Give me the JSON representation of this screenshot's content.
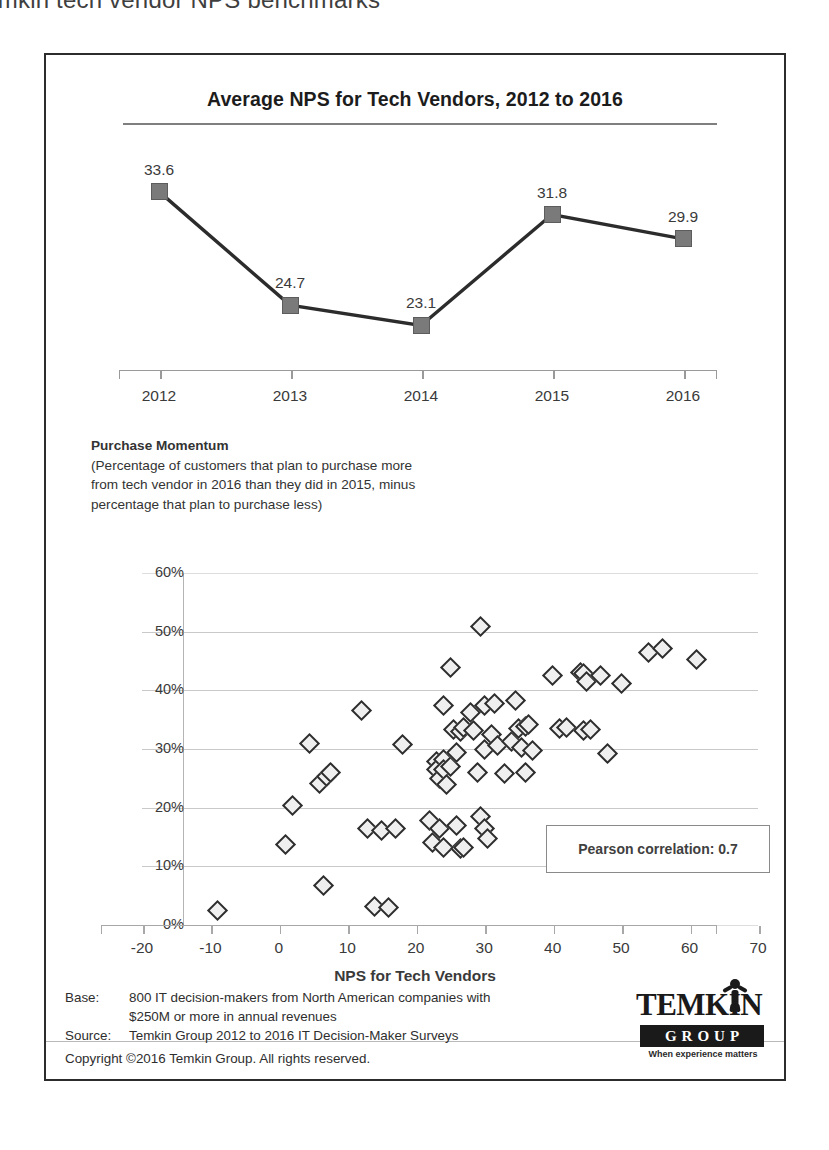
{
  "page": {
    "heading": "Temkin tech vendor NPS benchmarks"
  },
  "line_chart": {
    "title": "Average NPS for Tech Vendors, 2012 to 2016"
  },
  "momentum": {
    "title": "Purchase Momentum",
    "line1": "(Percentage of customers that plan to purchase more",
    "line2": "from tech vendor in 2016 than they did in 2015, minus",
    "line3": "percentage that plan to purchase less)"
  },
  "scatter": {
    "xtitle": "NPS for Tech Vendors",
    "annotation": "Pearson correlation: 0.7"
  },
  "footer": {
    "base_key": "Base:",
    "base_val": "800 IT decision-makers from North American companies with",
    "base_val2": "$250M or more in annual revenues",
    "source_key": "Source:",
    "source_val": "Temkin Group 2012 to 2016 IT Decision-Maker Surveys",
    "copyright": "Copyright ©2016 Temkin Group. All rights reserved."
  },
  "logo": {
    "wordmark": "TEMKIN",
    "group": "GROUP",
    "tagline": "When experience matters"
  },
  "colors": {
    "marker_fill": "#7a7a7a",
    "marker_stroke": "#5c5c5c",
    "line_stroke": "#2c2c2c",
    "dot_fill": "#efefef",
    "dot_stroke": "#2e2e2e",
    "grid": "#c9c9c9",
    "frame": "#2c2c2c"
  },
  "chart_data": [
    {
      "type": "line",
      "title": "Average NPS for Tech Vendors, 2012 to 2016",
      "xlabel": "",
      "ylabel": "",
      "categories": [
        "2012",
        "2013",
        "2014",
        "2015",
        "2016"
      ],
      "values": [
        33.6,
        24.7,
        23.1,
        31.8,
        29.9
      ],
      "data_labels": [
        "33.6",
        "24.7",
        "23.1",
        "31.8",
        "29.9"
      ],
      "ylim": [
        20,
        36
      ],
      "grid": false,
      "legend": "none",
      "marker": "square"
    },
    {
      "type": "scatter",
      "title": "",
      "xlabel": "NPS for Tech Vendors",
      "ylabel": "Purchase Momentum",
      "xlim": [
        -20,
        70
      ],
      "ylim": [
        0,
        60
      ],
      "xticks": [
        -20,
        -10,
        0,
        10,
        20,
        30,
        40,
        50,
        60,
        70
      ],
      "yticks": [
        "0%",
        "10%",
        "20%",
        "30%",
        "40%",
        "50%",
        "60%"
      ],
      "grid": true,
      "legend": "none",
      "marker": "diamond",
      "annotations": [
        "Pearson correlation: 0.7"
      ],
      "pearson_correlation": 0.7,
      "points": [
        [
          -9,
          2.5
        ],
        [
          1,
          13.8
        ],
        [
          2,
          20.3
        ],
        [
          4.5,
          31.0
        ],
        [
          6,
          24.2
        ],
        [
          6.5,
          6.8
        ],
        [
          7,
          25.3
        ],
        [
          7.5,
          26.0
        ],
        [
          12,
          36.6
        ],
        [
          13,
          16.4
        ],
        [
          14,
          3.1
        ],
        [
          15,
          16.1
        ],
        [
          16,
          3.0
        ],
        [
          17,
          16.5
        ],
        [
          18,
          30.8
        ],
        [
          22,
          17.8
        ],
        [
          22.5,
          14.0
        ],
        [
          23,
          27.8
        ],
        [
          23,
          26.5
        ],
        [
          23.5,
          25.0
        ],
        [
          23.5,
          16.5
        ],
        [
          24,
          37.5
        ],
        [
          24,
          28.2
        ],
        [
          24,
          26.5
        ],
        [
          24,
          13.2
        ],
        [
          24.5,
          24.0
        ],
        [
          25,
          27.0
        ],
        [
          25,
          43.9
        ],
        [
          25.5,
          33.3
        ],
        [
          26,
          29.4
        ],
        [
          26,
          17.0
        ],
        [
          26.5,
          33.0
        ],
        [
          26.5,
          13.0
        ],
        [
          27,
          33.6
        ],
        [
          27,
          13.2
        ],
        [
          28,
          36.2
        ],
        [
          28.5,
          33.2
        ],
        [
          29,
          26.0
        ],
        [
          29.5,
          50.9
        ],
        [
          29.5,
          18.5
        ],
        [
          30,
          37.4
        ],
        [
          30,
          30.0
        ],
        [
          30,
          16.5
        ],
        [
          30.5,
          14.7
        ],
        [
          31,
          32.5
        ],
        [
          31.5,
          37.8
        ],
        [
          32,
          30.6
        ],
        [
          33,
          25.8
        ],
        [
          34,
          31.2
        ],
        [
          34.5,
          38.2
        ],
        [
          35,
          33.5
        ],
        [
          35.5,
          30.2
        ],
        [
          36,
          33.8
        ],
        [
          36,
          26.0
        ],
        [
          36.5,
          34.2
        ],
        [
          37,
          29.8
        ],
        [
          40,
          42.5
        ],
        [
          41,
          33.5
        ],
        [
          42,
          33.7
        ],
        [
          44,
          43.0
        ],
        [
          44.5,
          42.9
        ],
        [
          44.5,
          33.2
        ],
        [
          45,
          41.5
        ],
        [
          45.5,
          33.4
        ],
        [
          47,
          42.6
        ],
        [
          48,
          29.2
        ],
        [
          50,
          41.2
        ],
        [
          54,
          46.5
        ],
        [
          56,
          47.2
        ],
        [
          61,
          45.2
        ]
      ]
    }
  ]
}
